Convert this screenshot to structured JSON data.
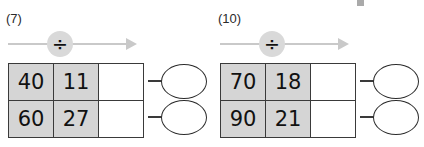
{
  "worksheet": {
    "operation_symbol": "÷",
    "arrow_icon": "right-arrow-icon",
    "shading_color": "#d5d5d5",
    "border_color": "#3a3a3a",
    "arrow_color": "#c9c9c9",
    "badge_color": "#d9d9d9",
    "problems": [
      {
        "number_label": "(7)",
        "rows": [
          {
            "dividend": "40",
            "divisor": "11",
            "quotient": "",
            "answer": ""
          },
          {
            "dividend": "60",
            "divisor": "27",
            "quotient": "",
            "answer": ""
          }
        ]
      },
      {
        "number_label": "(10)",
        "rows": [
          {
            "dividend": "70",
            "divisor": "18",
            "quotient": "",
            "answer": ""
          },
          {
            "dividend": "90",
            "divisor": "21",
            "quotient": "",
            "answer": ""
          }
        ]
      }
    ]
  }
}
